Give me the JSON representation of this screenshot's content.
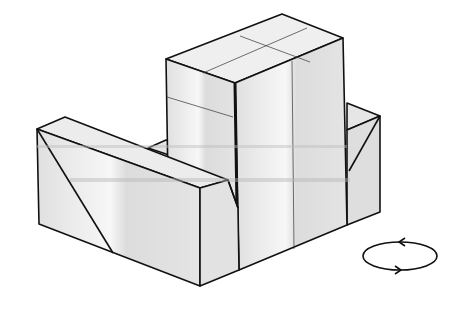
{
  "diagram": {
    "title": "Isometric view of stepped block with rotation indicator",
    "colors": {
      "face_light": "#ececec",
      "face_mid": "#e2e2e2",
      "face_dark": "#d6d6d6",
      "stroke": "#111111",
      "band": "#b8b8b8"
    },
    "rotation_symbol": {
      "icon": "rotate-horizontal-icon",
      "center": [
        400,
        256
      ],
      "rx": 37,
      "ry": 14,
      "arrow_top_direction": "left",
      "arrow_bottom_direction": "right"
    }
  }
}
